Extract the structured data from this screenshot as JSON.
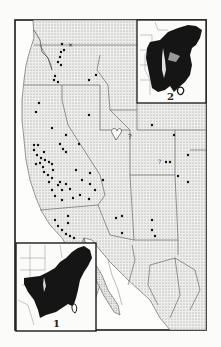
{
  "figure": {
    "type": "distribution-map",
    "region": "Western North America",
    "main_map": {
      "frame": {
        "x": 15,
        "y": 20,
        "w": 191,
        "h": 310
      },
      "states_shown": [
        "Washington",
        "Oregon",
        "California",
        "Idaho",
        "Nevada",
        "Utah",
        "Arizona",
        "Montana",
        "Wyoming",
        "Colorado",
        "New Mexico",
        "Baja California",
        "Sonora",
        "Chihuahua"
      ],
      "annotations": [
        {
          "text": "?",
          "x": 131,
          "y": 137
        },
        {
          "text": "?",
          "x": 160,
          "y": 162
        }
      ],
      "record_marker": "black-dot",
      "cross_marker": "x",
      "point_count_approx": 80
    },
    "inset_1": {
      "label": "1",
      "frame": {
        "x": 16,
        "y": 243,
        "w": 80,
        "h": 88
      },
      "description": "Eastern North America distribution (solid black)",
      "label_pos": {
        "x": 54,
        "y": 325
      }
    },
    "inset_2": {
      "label": "2",
      "frame": {
        "x": 137,
        "y": 20,
        "w": 69,
        "h": 83
      },
      "description": "Eastern North America distribution (solid black)",
      "label_pos": {
        "x": 170,
        "y": 100
      }
    },
    "colors": {
      "background": "#fbfbfa",
      "stipple": "#9a9a9a",
      "land_fill": "#e6e6e4",
      "ink": "#151515",
      "border": "#555555"
    }
  }
}
